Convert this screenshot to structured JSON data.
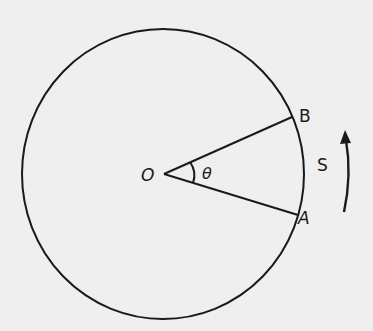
{
  "diagram": {
    "labels": {
      "center": "O",
      "angle": "θ",
      "point_a": "A",
      "point_b": "B",
      "arc": "S"
    },
    "colors": {
      "background": "#efefef",
      "stroke": "#1a1a1a"
    }
  }
}
